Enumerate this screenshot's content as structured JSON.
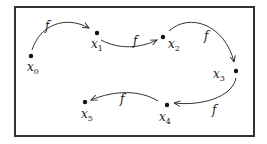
{
  "diagram": {
    "frame": {
      "x": 15,
      "y": 7,
      "w": 239,
      "h": 129,
      "stroke": "#333333"
    },
    "map_label": "f",
    "points": [
      {
        "id": "x0",
        "base": "x",
        "sub": "0",
        "cx": 31,
        "cy": 56,
        "lx": 27,
        "ly": 71
      },
      {
        "id": "x1",
        "base": "x",
        "sub": "1",
        "cx": 97,
        "cy": 33,
        "lx": 91,
        "ly": 48
      },
      {
        "id": "x2",
        "base": "x",
        "sub": "2",
        "cx": 163,
        "cy": 37,
        "lx": 168,
        "ly": 48
      },
      {
        "id": "x3",
        "base": "x",
        "sub": "3",
        "cx": 236,
        "cy": 71,
        "lx": 213,
        "ly": 78
      },
      {
        "id": "x4",
        "base": "x",
        "sub": "4",
        "cx": 167,
        "cy": 105,
        "lx": 159,
        "ly": 121
      },
      {
        "id": "x5",
        "base": "x",
        "sub": "5",
        "cx": 85,
        "cy": 102,
        "lx": 81,
        "ly": 118
      }
    ],
    "arrows": [
      {
        "from": "x0",
        "to": "x1",
        "label": "f",
        "d": "M 32 50 C 40 25, 65 15, 89 28",
        "lx": 45,
        "ly": 30
      },
      {
        "from": "x1",
        "to": "x2",
        "label": "f",
        "d": "M 101 40 C 120 50, 140 48, 157 40",
        "lx": 133,
        "ly": 45
      },
      {
        "from": "x2",
        "to": "x3",
        "label": "f",
        "d": "M 169 31 C 190 12, 225 25, 234 62",
        "lx": 204,
        "ly": 40
      },
      {
        "from": "x3",
        "to": "x4",
        "label": "f",
        "d": "M 236 78 C 232 98, 200 106, 174 103",
        "lx": 212,
        "ly": 114
      },
      {
        "from": "x4",
        "to": "x5",
        "label": "f",
        "d": "M 158 101 C 140 90, 115 90, 91 100",
        "lx": 120,
        "ly": 103
      }
    ]
  }
}
